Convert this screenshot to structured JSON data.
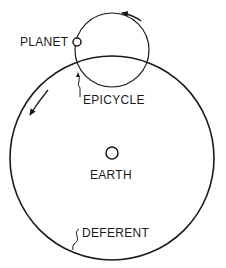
{
  "diagram": {
    "type": "ptolemaic-epicycle-model",
    "labels": {
      "planet": "PLANET",
      "epicycle": "EPICYCLE",
      "earth": "EARTH",
      "deferent": "DEFERENT"
    },
    "colors": {
      "stroke": "#1a1a1a",
      "background": "#ffffff"
    },
    "elements": {
      "deferent": {
        "cx": 112,
        "cy": 158,
        "r": 102
      },
      "epicycle": {
        "cx": 112,
        "cy": 50,
        "r": 37
      },
      "planet": {
        "cx": 77,
        "cy": 42,
        "r": 4
      },
      "earth": {
        "cx": 112,
        "cy": 153,
        "r": 6
      }
    },
    "arrows": {
      "epicycle_motion": "counterclockwise (arrow along top of epicycle pointing left)",
      "deferent_motion": "counterclockwise (arrow along upper-left of deferent pointing down-left)"
    }
  }
}
